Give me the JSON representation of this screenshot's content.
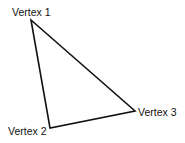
{
  "diagram": {
    "type": "triangle",
    "stroke_color": "#111111",
    "background": "#ffffff",
    "vertices": [
      {
        "label": "Vertex 1",
        "x": 31,
        "y": 20
      },
      {
        "label": "Vertex 2",
        "x": 50,
        "y": 128
      },
      {
        "label": "Vertex 3",
        "x": 135,
        "y": 111
      }
    ]
  }
}
